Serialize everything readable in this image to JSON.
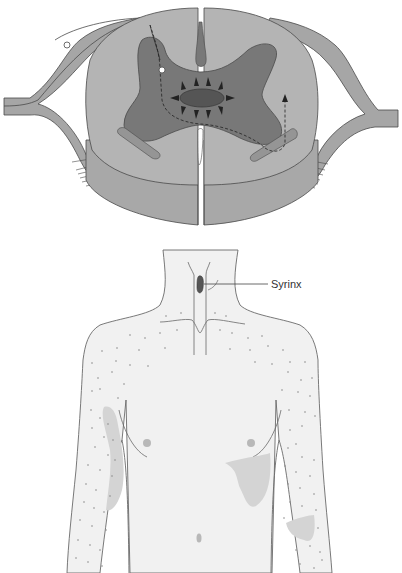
{
  "figure": {
    "panels": [
      {
        "id": "spinal-cord-cross-section",
        "description": "Cross-section of cervical spinal cord with central syrinx expanding outward, disrupting crossing spinothalamic fibers"
      },
      {
        "id": "body-sensory-map",
        "description": "Anterior torso showing cape-like distribution of sensory loss (stippled) over shoulders and arms"
      }
    ],
    "labels": {
      "syrinx": "Syrinx"
    },
    "colors": {
      "white_matter": "#b4b4b4",
      "white_matter_lower": "#a8a8a8",
      "gray_matter": "#787878",
      "syrinx": "#555555",
      "nerve_roots": "#a6a6a6",
      "outline": "#4a4a4a",
      "skin": "#f1f1f1",
      "skin_outline": "#6a6a6a",
      "stipple": "#888888",
      "shaded_areas": "#d4d4d4",
      "nipple": "#b8b8b8"
    },
    "annotations": {
      "pathway": "dashed fiber pathway from dorsal root through anterior commissure to contralateral spinothalamic tract",
      "expansion_arrows": 10
    }
  }
}
